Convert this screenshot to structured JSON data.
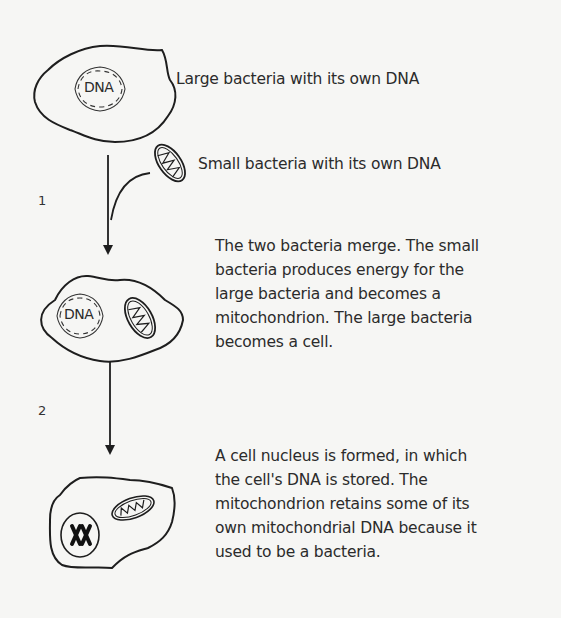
{
  "labels": {
    "large_bacteria": "Large bacteria with its own DNA",
    "small_bacteria": "Small bacteria with its own DNA",
    "dna_text": "DNA"
  },
  "steps": [
    {
      "number": "1",
      "description_lines": [
        "The two bacteria merge. The small",
        "bacteria produces energy for the",
        "large bacteria and becomes a",
        "mitochondrion. The large bacteria",
        "becomes a cell."
      ]
    },
    {
      "number": "2",
      "description_lines": [
        "A cell nucleus is formed, in which",
        "the cell's DNA is stored. The",
        "mitochondrion retains some of its",
        "own mitochondrial DNA because it",
        "used to be a bacteria."
      ]
    }
  ],
  "colors": {
    "background": "#f6f6f4",
    "stroke": "#1e1e1e",
    "text": "#2b2b2b"
  }
}
